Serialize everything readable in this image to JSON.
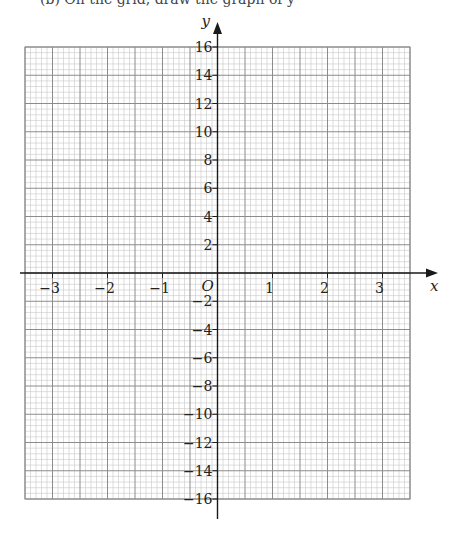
{
  "caption_fragment": "(b)  On the grid, draw the graph of y",
  "chart_data": {
    "type": "scatter",
    "title": "",
    "xlabel": "x",
    "ylabel": "y",
    "origin_label": "O",
    "xlim": [
      -3.5,
      3.5
    ],
    "ylim": [
      -16,
      16
    ],
    "x_ticks": [
      -3,
      -2,
      -1,
      1,
      2,
      3
    ],
    "x_tick_labels": [
      "−3",
      "−2",
      "−1",
      "1",
      "2",
      "3"
    ],
    "y_ticks": [
      16,
      14,
      12,
      10,
      8,
      6,
      4,
      2,
      -2,
      -4,
      -6,
      -8,
      -10,
      -12,
      -14,
      -16
    ],
    "y_tick_labels": [
      "16",
      "14",
      "12",
      "10",
      "8",
      "6",
      "4",
      "2",
      "−2",
      "−4",
      "−6",
      "−8",
      "−10",
      "−12",
      "−14",
      "−16"
    ],
    "x_major_step": 0.5,
    "x_minor_step": 0.1,
    "y_major_step": 2,
    "y_minor_step": 0.4,
    "grid": true,
    "series": [],
    "colors": {
      "axis": "#1a1a1a",
      "major_grid": "#8c8c8c",
      "minor_grid": "#c8c8c8"
    }
  }
}
